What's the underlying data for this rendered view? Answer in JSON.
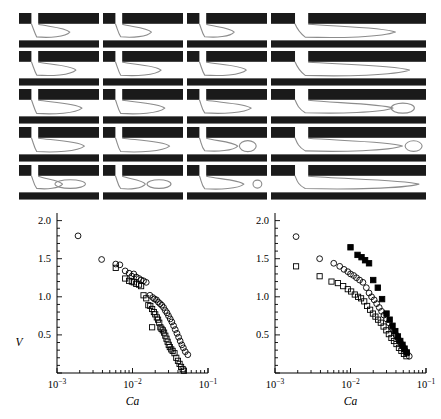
{
  "figure": {
    "panels_caption": "",
    "grid": {
      "rows": 5,
      "cols": 4,
      "description": "microfluidic T-junction droplet breakup snapshots",
      "col_widths": [
        80,
        80,
        80,
        155
      ],
      "row_height": 36,
      "wall_color": "#1a1a1a",
      "channel_color": "#ffffff",
      "interface_color": "#8c8c8c",
      "cells": [
        {
          "row": 0,
          "col": 0,
          "name": "snapshot-r1c1",
          "neck": 0.3,
          "tip": 0.52,
          "bulge": 0.2,
          "detached": false,
          "drops": []
        },
        {
          "row": 0,
          "col": 1,
          "name": "snapshot-r1c2",
          "neck": 0.26,
          "tip": 0.48,
          "bulge": 0.18,
          "detached": false,
          "drops": []
        },
        {
          "row": 0,
          "col": 2,
          "name": "snapshot-r1c3",
          "neck": 0.24,
          "tip": 0.46,
          "bulge": 0.17,
          "detached": false,
          "drops": []
        },
        {
          "row": 0,
          "col": 3,
          "name": "snapshot-r1c4",
          "neck": 0.22,
          "tip": 0.74,
          "bulge": 0.22,
          "detached": false,
          "drops": []
        },
        {
          "row": 1,
          "col": 0,
          "name": "snapshot-r2c1",
          "neck": 0.28,
          "tip": 0.62,
          "bulge": 0.22,
          "detached": false,
          "drops": []
        },
        {
          "row": 1,
          "col": 1,
          "name": "snapshot-r2c2",
          "neck": 0.26,
          "tip": 0.64,
          "bulge": 0.24,
          "detached": false,
          "drops": []
        },
        {
          "row": 1,
          "col": 2,
          "name": "snapshot-r2c3",
          "neck": 0.24,
          "tip": 0.66,
          "bulge": 0.22,
          "detached": false,
          "drops": []
        },
        {
          "row": 1,
          "col": 3,
          "name": "snapshot-r2c4",
          "neck": 0.2,
          "tip": 0.86,
          "bulge": 0.26,
          "detached": false,
          "drops": []
        },
        {
          "row": 2,
          "col": 0,
          "name": "snapshot-r3c1",
          "neck": 0.26,
          "tip": 0.72,
          "bulge": 0.26,
          "detached": false,
          "drops": []
        },
        {
          "row": 2,
          "col": 1,
          "name": "snapshot-r3c2",
          "neck": 0.22,
          "tip": 0.7,
          "bulge": 0.26,
          "detached": false,
          "drops": []
        },
        {
          "row": 2,
          "col": 2,
          "name": "snapshot-r3c3",
          "neck": 0.2,
          "tip": 0.74,
          "bulge": 0.2,
          "detached": false,
          "drops": []
        },
        {
          "row": 2,
          "col": 3,
          "name": "snapshot-r3c4",
          "neck": 0.18,
          "tip": 0.72,
          "bulge": 0.16,
          "detached": true,
          "drops": [
            {
              "cx": 0.85,
              "rx": 0.075,
              "ry": 0.3
            }
          ]
        },
        {
          "row": 3,
          "col": 0,
          "name": "snapshot-r4c1",
          "neck": 0.24,
          "tip": 0.76,
          "bulge": 0.28,
          "detached": false,
          "drops": []
        },
        {
          "row": 3,
          "col": 1,
          "name": "snapshot-r4c2",
          "neck": 0.2,
          "tip": 0.78,
          "bulge": 0.28,
          "detached": false,
          "drops": []
        },
        {
          "row": 3,
          "col": 2,
          "name": "snapshot-r4c3",
          "neck": 0.18,
          "tip": 0.52,
          "bulge": 0.16,
          "detached": true,
          "drops": [
            {
              "cx": 0.76,
              "rx": 0.105,
              "ry": 0.33
            }
          ]
        },
        {
          "row": 3,
          "col": 3,
          "name": "snapshot-r4c4",
          "neck": 0.16,
          "tip": 0.8,
          "bulge": 0.2,
          "detached": true,
          "drops": [
            {
              "cx": 0.92,
              "rx": 0.055,
              "ry": 0.32
            }
          ]
        },
        {
          "row": 4,
          "col": 0,
          "name": "snapshot-r5c1",
          "neck": 0.22,
          "tip": 0.4,
          "bulge": 0.12,
          "detached": true,
          "drops": [
            {
              "cx": 0.64,
              "rx": 0.19,
              "ry": 0.26
            }
          ]
        },
        {
          "row": 4,
          "col": 1,
          "name": "snapshot-r5c2",
          "neck": 0.2,
          "tip": 0.38,
          "bulge": 0.14,
          "detached": true,
          "drops": [
            {
              "cx": 0.7,
              "rx": 0.15,
              "ry": 0.26
            }
          ]
        },
        {
          "row": 4,
          "col": 2,
          "name": "snapshot-r5c3",
          "neck": 0.18,
          "tip": 0.62,
          "bulge": 0.16,
          "detached": true,
          "drops": [
            {
              "cx": 0.88,
              "rx": 0.055,
              "ry": 0.24
            }
          ]
        },
        {
          "row": 4,
          "col": 3,
          "name": "snapshot-r5c4",
          "neck": 0.14,
          "tip": 0.94,
          "bulge": 0.14,
          "detached": false,
          "drops": []
        }
      ]
    }
  },
  "chart_data": [
    {
      "name": "left-plot",
      "type": "scatter",
      "title": "",
      "xlabel": "Ca",
      "ylabel": "V",
      "xscale": "log",
      "yscale": "linear",
      "xlim": [
        0.001,
        0.1
      ],
      "ylim": [
        0,
        2.1
      ],
      "xticks": [
        0.001,
        0.01,
        0.1
      ],
      "xticklabels": [
        "10-3",
        "10-2",
        "10-1"
      ],
      "yticks": [
        0.5,
        1.0,
        1.5,
        2.0
      ],
      "yticklabels": [
        "0.5",
        "1.0",
        "1.5",
        "2.0"
      ],
      "grid": false,
      "legend": "none",
      "series": [
        {
          "name": "open-circles",
          "marker": "open-circle",
          "points": [
            [
              0.0019,
              1.8
            ],
            [
              0.0039,
              1.49
            ],
            [
              0.006,
              1.43
            ],
            [
              0.0068,
              1.42
            ],
            [
              0.008,
              1.34
            ],
            [
              0.009,
              1.31
            ],
            [
              0.0098,
              1.27
            ],
            [
              0.0104,
              1.3
            ],
            [
              0.0112,
              1.26
            ],
            [
              0.0122,
              1.24
            ],
            [
              0.013,
              1.22
            ],
            [
              0.014,
              1.21
            ],
            [
              0.0152,
              1.19
            ],
            [
              0.017,
              1.02
            ],
            [
              0.0186,
              0.99
            ],
            [
              0.0196,
              0.97
            ],
            [
              0.0208,
              0.96
            ],
            [
              0.022,
              0.93
            ],
            [
              0.0232,
              0.91
            ],
            [
              0.0244,
              0.89
            ],
            [
              0.0258,
              0.86
            ],
            [
              0.0272,
              0.82
            ],
            [
              0.0286,
              0.79
            ],
            [
              0.03,
              0.75
            ],
            [
              0.0316,
              0.71
            ],
            [
              0.0332,
              0.67
            ],
            [
              0.035,
              0.62
            ],
            [
              0.0368,
              0.57
            ],
            [
              0.0388,
              0.52
            ],
            [
              0.0408,
              0.47
            ],
            [
              0.0428,
              0.42
            ],
            [
              0.045,
              0.37
            ],
            [
              0.0472,
              0.33
            ],
            [
              0.05,
              0.28
            ],
            [
              0.054,
              0.24
            ]
          ]
        },
        {
          "name": "open-squares",
          "marker": "open-square",
          "points": [
            [
              0.006,
              1.38
            ],
            [
              0.008,
              1.24
            ],
            [
              0.009,
              1.21
            ],
            [
              0.0098,
              1.2
            ],
            [
              0.0104,
              1.19
            ],
            [
              0.0112,
              1.17
            ],
            [
              0.0122,
              1.16
            ],
            [
              0.013,
              1.14
            ],
            [
              0.014,
              1.02
            ],
            [
              0.0152,
              0.98
            ],
            [
              0.0162,
              0.89
            ],
            [
              0.0172,
              0.88
            ],
            [
              0.0182,
              0.84
            ],
            [
              0.0192,
              0.8
            ],
            [
              0.02,
              0.77
            ],
            [
              0.021,
              0.73
            ],
            [
              0.0218,
              0.7
            ],
            [
              0.0226,
              0.66
            ],
            [
              0.0234,
              0.6
            ],
            [
              0.0242,
              0.58
            ],
            [
              0.0252,
              0.56
            ],
            [
              0.0262,
              0.53
            ],
            [
              0.0272,
              0.49
            ],
            [
              0.0282,
              0.45
            ],
            [
              0.0292,
              0.41
            ],
            [
              0.0302,
              0.37
            ],
            [
              0.0312,
              0.34
            ],
            [
              0.0326,
              0.31
            ],
            [
              0.034,
              0.29
            ],
            [
              0.036,
              0.26
            ],
            [
              0.038,
              0.2
            ],
            [
              0.04,
              0.16
            ],
            [
              0.042,
              0.12
            ],
            [
              0.044,
              0.08
            ],
            [
              0.0462,
              0.05
            ],
            [
              0.048,
              0.03
            ],
            [
              0.0182,
              0.6
            ]
          ]
        }
      ]
    },
    {
      "name": "right-plot",
      "type": "scatter",
      "title": "",
      "xlabel": "Ca",
      "ylabel": "",
      "xscale": "log",
      "yscale": "linear",
      "xlim": [
        0.001,
        0.1
      ],
      "ylim": [
        0,
        2.1
      ],
      "xticks": [
        0.001,
        0.01,
        0.1
      ],
      "xticklabels": [
        "10-3",
        "10-2",
        "10-1"
      ],
      "yticks": [
        0.5,
        1.0,
        1.5,
        2.0
      ],
      "yticklabels": [
        "0.5",
        "1.0",
        "1.5",
        "2.0"
      ],
      "grid": false,
      "legend": "none",
      "series": [
        {
          "name": "open-circles",
          "marker": "open-circle",
          "points": [
            [
              0.0019,
              1.79
            ],
            [
              0.0039,
              1.5
            ],
            [
              0.006,
              1.44
            ],
            [
              0.0072,
              1.4
            ],
            [
              0.0082,
              1.36
            ],
            [
              0.0092,
              1.33
            ],
            [
              0.01,
              1.3
            ],
            [
              0.011,
              1.28
            ],
            [
              0.012,
              1.25
            ],
            [
              0.0132,
              1.22
            ],
            [
              0.0146,
              1.19
            ],
            [
              0.0162,
              1.12
            ],
            [
              0.0176,
              1.05
            ],
            [
              0.019,
              1.0
            ],
            [
              0.0206,
              0.96
            ],
            [
              0.0222,
              0.91
            ],
            [
              0.024,
              0.86
            ],
            [
              0.0258,
              0.81
            ],
            [
              0.0278,
              0.76
            ],
            [
              0.03,
              0.71
            ],
            [
              0.0322,
              0.66
            ],
            [
              0.0346,
              0.6
            ],
            [
              0.0372,
              0.55
            ],
            [
              0.04,
              0.5
            ],
            [
              0.0428,
              0.45
            ],
            [
              0.0458,
              0.4
            ],
            [
              0.049,
              0.35
            ],
            [
              0.0524,
              0.3
            ],
            [
              0.056,
              0.26
            ],
            [
              0.06,
              0.22
            ]
          ]
        },
        {
          "name": "open-squares",
          "marker": "open-square",
          "points": [
            [
              0.0019,
              1.4
            ],
            [
              0.0039,
              1.27
            ],
            [
              0.0056,
              1.2
            ],
            [
              0.0068,
              1.18
            ],
            [
              0.008,
              1.14
            ],
            [
              0.0092,
              1.1
            ],
            [
              0.0102,
              1.07
            ],
            [
              0.0114,
              1.03
            ],
            [
              0.0126,
              1.0
            ],
            [
              0.0138,
              0.98
            ],
            [
              0.0152,
              0.94
            ],
            [
              0.0166,
              0.88
            ],
            [
              0.0182,
              0.83
            ],
            [
              0.0198,
              0.78
            ],
            [
              0.0214,
              0.74
            ],
            [
              0.0232,
              0.7
            ],
            [
              0.0252,
              0.66
            ],
            [
              0.0274,
              0.61
            ],
            [
              0.0298,
              0.56
            ],
            [
              0.0322,
              0.51
            ],
            [
              0.0348,
              0.46
            ],
            [
              0.0376,
              0.42
            ],
            [
              0.0406,
              0.38
            ],
            [
              0.0438,
              0.33
            ],
            [
              0.0472,
              0.29
            ],
            [
              0.051,
              0.25
            ],
            [
              0.055,
              0.22
            ]
          ]
        },
        {
          "name": "filled-squares",
          "marker": "filled-square",
          "points": [
            [
              0.01,
              1.65
            ],
            [
              0.0124,
              1.55
            ],
            [
              0.014,
              1.52
            ],
            [
              0.0156,
              1.48
            ],
            [
              0.0176,
              1.44
            ],
            [
              0.02,
              1.22
            ],
            [
              0.023,
              1.12
            ],
            [
              0.0262,
              0.97
            ],
            [
              0.03,
              0.78
            ],
            [
              0.033,
              0.7
            ],
            [
              0.036,
              0.62
            ],
            [
              0.0392,
              0.55
            ],
            [
              0.0424,
              0.48
            ],
            [
              0.0456,
              0.42
            ],
            [
              0.0488,
              0.37
            ],
            [
              0.052,
              0.32
            ],
            [
              0.0556,
              0.27
            ]
          ]
        }
      ]
    }
  ]
}
